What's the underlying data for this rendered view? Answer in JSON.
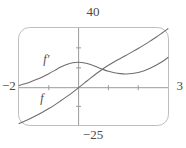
{
  "figure": {
    "kind": "graphing-calculator-window",
    "frame": {
      "style": "rounded-rectangle",
      "stroke": "#b8b8b8"
    },
    "labels": {
      "ymax": "40",
      "ymin": "−25",
      "xmin": "−2",
      "xmax": "3",
      "curve_f": "f",
      "curve_fprime": "f′"
    },
    "colors": {
      "curve": "#6e6e6e",
      "axis": "#8d8d8d",
      "frame": "#bdbdbd",
      "text": "#4a4a4a",
      "background": "#ffffff"
    }
  },
  "chart_data": {
    "type": "line",
    "title": "",
    "xlabel": "",
    "ylabel": "",
    "xlim": [
      -2,
      3
    ],
    "ylim": [
      -25,
      40
    ],
    "grid": false,
    "legend": "inline-curve-labels",
    "axes": {
      "x_axis_visible": true,
      "y_axis_visible": true,
      "x_ticks": [
        -2,
        -1,
        0,
        1,
        2,
        3
      ],
      "y_ticks": [
        -25,
        -12.5,
        0,
        13.3,
        26.7,
        40
      ],
      "tick_labels_shown": [
        "-2",
        "3",
        "40",
        "-25"
      ]
    },
    "series": [
      {
        "name": "f",
        "label": "f",
        "label_position": {
          "x": -1.15,
          "y": -7.0
        },
        "x": [
          -2.0,
          -1.8,
          -1.6,
          -1.4,
          -1.2,
          -1.0,
          -0.8,
          -0.6,
          -0.4,
          -0.2,
          0.0,
          0.2,
          0.4,
          0.6,
          0.8,
          1.0,
          1.2,
          1.4,
          1.6,
          1.8,
          2.0,
          2.2,
          2.4,
          2.6,
          2.8,
          3.0
        ],
        "y": [
          -24.0,
          -22.3,
          -20.5,
          -18.5,
          -16.3,
          -14.0,
          -11.5,
          -8.8,
          -6.0,
          -3.1,
          0.0,
          3.2,
          6.4,
          9.5,
          12.4,
          15.0,
          17.4,
          19.6,
          21.8,
          24.0,
          26.3,
          28.7,
          31.2,
          33.8,
          36.6,
          39.5
        ]
      },
      {
        "name": "fprime",
        "label": "f′",
        "label_position": {
          "x": -1.05,
          "y": 19.5
        },
        "x": [
          -2.0,
          -1.8,
          -1.6,
          -1.4,
          -1.2,
          -1.0,
          -0.8,
          -0.6,
          -0.4,
          -0.2,
          0.0,
          0.2,
          0.4,
          0.6,
          0.8,
          1.0,
          1.2,
          1.4,
          1.6,
          1.8,
          2.0,
          2.2,
          2.4,
          2.6,
          2.8,
          3.0
        ],
        "y": [
          1.5,
          2.6,
          4.0,
          5.6,
          7.4,
          9.4,
          11.6,
          13.8,
          15.6,
          16.7,
          17.0,
          16.6,
          15.5,
          14.0,
          12.4,
          11.0,
          10.0,
          9.4,
          9.2,
          9.5,
          10.2,
          11.4,
          13.0,
          15.0,
          17.4,
          20.2
        ]
      }
    ]
  }
}
